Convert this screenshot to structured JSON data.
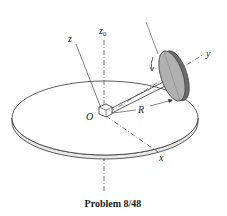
{
  "figure": {
    "caption": "Problem 8/48",
    "labels": {
      "z0": "z",
      "z0_sub": "0",
      "z": "z",
      "y": "y",
      "x": "x",
      "origin": "O",
      "radius": "R"
    },
    "colors": {
      "line": "#333333",
      "wheel_fill": "#a9a9a9",
      "wheel_edge": "#5a5a5a",
      "disc_fill": "#ffffff",
      "background": "#ffffff"
    }
  }
}
